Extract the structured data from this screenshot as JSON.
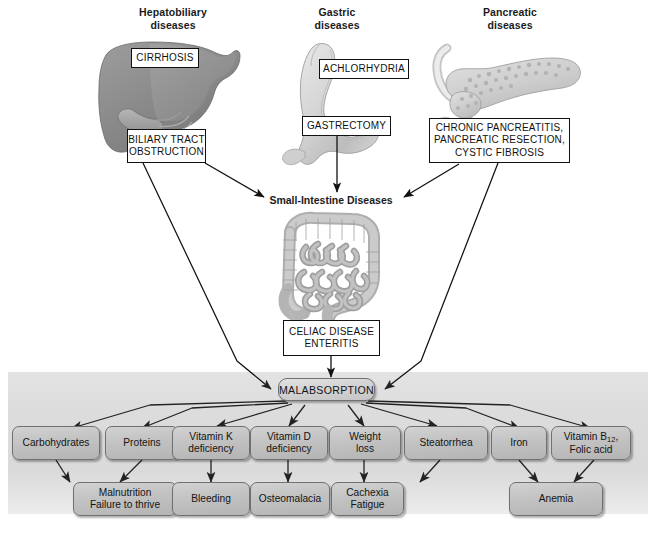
{
  "diagram": {
    "section_headers": [
      {
        "id": "hepatobiliary",
        "label": "Hepatobiliary\ndiseases"
      },
      {
        "id": "gastric",
        "label": "Gastric\ndiseases"
      },
      {
        "id": "pancreatic",
        "label": "Pancreatic\ndiseases"
      }
    ],
    "mid_caption": "Small-Intestine Diseases",
    "cause_labels": [
      {
        "id": "cirrhosis",
        "label": "CIRRHOSIS"
      },
      {
        "id": "biliary-tract",
        "label": "BILIARY TRACT\nOBSTRUCTION"
      },
      {
        "id": "achlorhydria",
        "label": "ACHLORHYDRIA"
      },
      {
        "id": "gastrectomy",
        "label": "GASTRECTOMY"
      },
      {
        "id": "chronic-pancreatitis",
        "label": "CHRONIC PANCREATITIS,\nPANCREATIC RESECTION,\nCYSTIC FIBROSIS"
      },
      {
        "id": "celiac-disease",
        "label": "CELIAC DISEASE\nENTERITIS"
      }
    ],
    "central_node": {
      "id": "malabsorption",
      "label": "MALABSORPTION"
    },
    "deficiency_chips": [
      {
        "id": "carbohydrates",
        "label": "Carbohydrates"
      },
      {
        "id": "proteins",
        "label": "Proteins"
      },
      {
        "id": "vitamin-k",
        "label": "Vitamin K\ndeficiency"
      },
      {
        "id": "vitamin-d",
        "label": "Vitamin D\ndeficiency"
      },
      {
        "id": "weight-loss",
        "label": "Weight\nloss"
      },
      {
        "id": "steatorrhea",
        "label": "Steatorrhea"
      },
      {
        "id": "iron",
        "label": "Iron"
      },
      {
        "id": "vitamin-b12",
        "label": "Vitamin B12,\nFolic acid",
        "label_main": "Vitamin B",
        "label_sub": "12",
        "label_tail": ",",
        "label_line2": "Folic acid"
      }
    ],
    "outcome_chips": [
      {
        "id": "malnutrition",
        "label": "Malnutrition\nFailure to thrive"
      },
      {
        "id": "bleeding",
        "label": "Bleeding"
      },
      {
        "id": "osteomalacia",
        "label": "Osteomalacia"
      },
      {
        "id": "cachexia",
        "label": "Cachexia\nFatigue"
      },
      {
        "id": "anemia",
        "label": "Anemia"
      }
    ],
    "organs": [
      {
        "id": "liver",
        "label": "liver-illustration"
      },
      {
        "id": "stomach",
        "label": "stomach-illustration"
      },
      {
        "id": "pancreas",
        "label": "pancreas-illustration"
      },
      {
        "id": "small-intestine",
        "label": "small-intestine-illustration"
      }
    ],
    "colors": {
      "panel_bg": "#dcdcdc",
      "chip_fill": "#c3c3c3",
      "chip_border": "#707070",
      "line": "#111111",
      "text": "#111111",
      "page_bg": "#ffffff"
    }
  }
}
